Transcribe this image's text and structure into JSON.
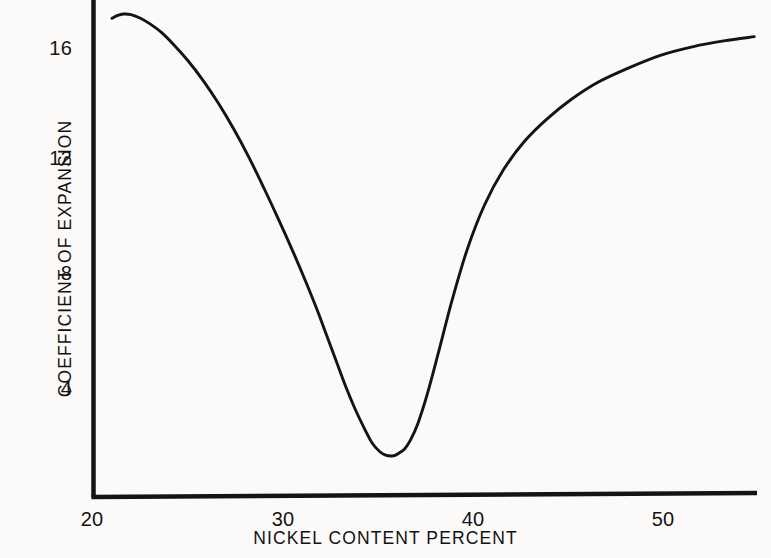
{
  "figure": {
    "width": 771,
    "height": 558,
    "background_color": "#fbfaf8",
    "ink_color": "#141414"
  },
  "chart_data": {
    "type": "line",
    "title": "",
    "subtitle": "",
    "xlabel": "NICKEL CONTENT PERCENT",
    "ylabel": "COEFFICIENT OF EXPANSION",
    "xlim": [
      20,
      54.8
    ],
    "ylim": [
      0,
      17.6
    ],
    "grid": false,
    "legend": null,
    "annotations": [],
    "x_ticks": [
      20,
      30,
      40,
      50
    ],
    "x_tick_labels": [
      "20",
      "30",
      "40",
      "50"
    ],
    "y_ticks": [
      4,
      8,
      12,
      16
    ],
    "y_tick_labels": [
      "4",
      "8",
      "12",
      "16"
    ],
    "axis_style": "open-L (left spine and bottom spine only, no tick marks)",
    "series": [
      {
        "name": "Coefficient of expansion of iron-nickel alloy",
        "x": [
          21.0,
          21.3,
          21.6,
          22.0,
          22.5,
          23.0,
          23.6,
          24.2,
          25.0,
          25.8,
          26.6,
          27.4,
          28.2,
          29.0,
          29.8,
          30.6,
          31.2,
          31.8,
          32.3,
          32.8,
          33.3,
          33.8,
          34.3,
          34.7,
          35.1,
          35.4,
          35.7,
          35.9,
          36.1,
          36.4,
          36.7,
          37.1,
          37.6,
          38.2,
          38.9,
          39.7,
          40.6,
          41.6,
          42.7,
          43.9,
          45.2,
          46.6,
          48.2,
          49.9,
          51.6,
          53.2,
          54.8
        ],
        "y": [
          17.05,
          17.15,
          17.2,
          17.18,
          17.05,
          16.85,
          16.55,
          16.15,
          15.55,
          14.85,
          14.05,
          13.15,
          12.15,
          11.05,
          9.9,
          8.7,
          7.75,
          6.75,
          5.85,
          4.95,
          4.05,
          3.25,
          2.55,
          2.05,
          1.75,
          1.63,
          1.6,
          1.62,
          1.7,
          1.85,
          2.15,
          2.75,
          3.8,
          5.3,
          7.1,
          8.9,
          10.45,
          11.7,
          12.7,
          13.5,
          14.2,
          14.8,
          15.3,
          15.75,
          16.05,
          16.25,
          16.4
        ]
      }
    ]
  }
}
